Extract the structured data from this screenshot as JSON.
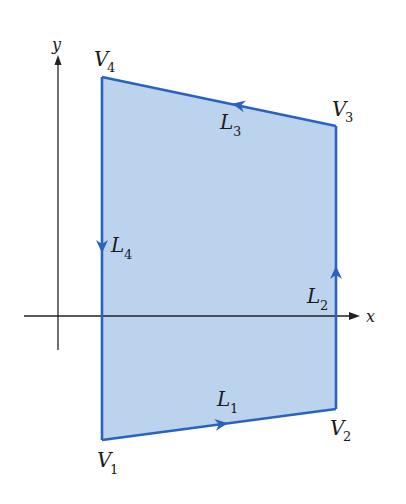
{
  "diagram": {
    "type": "polygon-contour",
    "colors": {
      "fill": "#bcd3ee",
      "edge": "#2a62c2",
      "axis": "#222222",
      "text": "#1a1a1a"
    },
    "axes": {
      "x_label": "x",
      "y_label": "y"
    },
    "vertices": [
      {
        "name": "V",
        "sub": "1",
        "x": 102,
        "y": 440
      },
      {
        "name": "V",
        "sub": "2",
        "x": 336,
        "y": 409
      },
      {
        "name": "V",
        "sub": "3",
        "x": 336,
        "y": 126
      },
      {
        "name": "V",
        "sub": "4",
        "x": 102,
        "y": 77
      }
    ],
    "edges": [
      {
        "name": "L",
        "sub": "1",
        "from": "V1",
        "to": "V2",
        "direction": "right"
      },
      {
        "name": "L",
        "sub": "2",
        "from": "V2",
        "to": "V3",
        "direction": "up"
      },
      {
        "name": "L",
        "sub": "3",
        "from": "V3",
        "to": "V4",
        "direction": "left"
      },
      {
        "name": "L",
        "sub": "4",
        "from": "V4",
        "to": "V1",
        "direction": "down"
      }
    ]
  }
}
